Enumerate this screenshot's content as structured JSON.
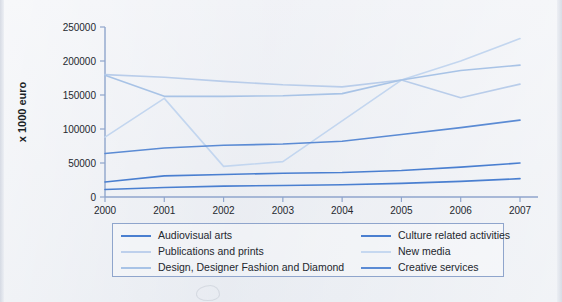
{
  "chart_data": {
    "type": "line",
    "title": "",
    "xlabel": "",
    "ylabel": "x 1000 euro",
    "x": [
      "2000",
      "2001",
      "2002",
      "2003",
      "2004",
      "2005",
      "2006",
      "2007"
    ],
    "xlim": [
      2000,
      2007
    ],
    "ylim": [
      0,
      250000
    ],
    "yticks": [
      0,
      50000,
      100000,
      150000,
      200000,
      250000
    ],
    "ytick_labels": [
      "0",
      "50000",
      "100000",
      "150000",
      "200000",
      "250000"
    ],
    "grid": false,
    "legend_position": "bottom",
    "series": [
      {
        "name": "Audiovisual arts",
        "color": "#4a7fd0",
        "values": [
          11000,
          14000,
          16000,
          17000,
          18000,
          20000,
          23000,
          27000
        ]
      },
      {
        "name": "Culture related activities",
        "color": "#4a7fd0",
        "values": [
          22000,
          31000,
          33000,
          35000,
          36000,
          39000,
          44000,
          50000
        ]
      },
      {
        "name": "Publications and prints",
        "color": "#b9cdea",
        "values": [
          180000,
          176000,
          170000,
          165000,
          162000,
          172000,
          146000,
          166000
        ]
      },
      {
        "name": "New media",
        "color": "#c3d6ef",
        "values": [
          88000,
          145000,
          45000,
          52000,
          112000,
          172000,
          200000,
          233000
        ]
      },
      {
        "name": "Design, Designer Fashion and Diamond",
        "color": "#a8c3e6",
        "values": [
          179000,
          148000,
          148000,
          149000,
          152000,
          172000,
          186000,
          194000
        ]
      },
      {
        "name": "Creative services",
        "color": "#5b8bd4",
        "values": [
          64000,
          72000,
          76000,
          78000,
          82000,
          92000,
          102000,
          113000
        ]
      }
    ]
  },
  "legend": {
    "columns": [
      {
        "items": [
          {
            "label": "Audiovisual arts",
            "color": "#4a7fd0"
          },
          {
            "label": "Publications and prints",
            "color": "#bed0ec"
          },
          {
            "label": "Design, Designer Fashion and Diamond",
            "color": "#a8c3e6"
          }
        ]
      },
      {
        "items": [
          {
            "label": "Culture related activities",
            "color": "#4a7fd0"
          },
          {
            "label": "New media",
            "color": "#c6d8f0"
          },
          {
            "label": "Creative services",
            "color": "#5b8bd4"
          }
        ]
      }
    ]
  },
  "axes": {
    "y_title": "x 1000 euro",
    "y_tick_labels": [
      "250000",
      "200000",
      "150000",
      "100000",
      "50000",
      "0"
    ],
    "x_tick_labels": [
      "2000",
      "2001",
      "2002",
      "2003",
      "2004",
      "2005",
      "2006",
      "2007"
    ],
    "axis_color": "#8fa5cc"
  }
}
